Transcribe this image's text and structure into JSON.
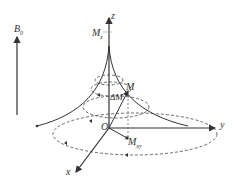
{
  "diagram": {
    "labels": {
      "b0": "B",
      "b0_sub": "0",
      "z": "z",
      "mz": "M",
      "mz_sub": "z",
      "m": "M",
      "delta_m": "ΔM",
      "origin": "O",
      "mxy": "M",
      "mxy_sub": "xy",
      "y": "y",
      "x": "x"
    },
    "caption": "Fig. — M(t) spiral trajectory"
  }
}
